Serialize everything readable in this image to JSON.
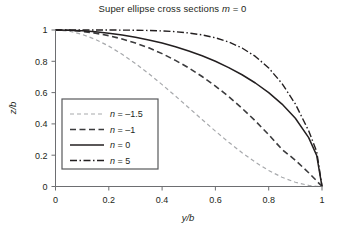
{
  "chart_data": {
    "type": "line",
    "title": "Super ellipse cross sections m = 0",
    "title_plain": "Super ellipse cross sections ",
    "title_italic_var": "m",
    "title_tail": " = 0",
    "xlabel": "y/b",
    "ylabel": "z/b",
    "xlim": [
      0,
      1
    ],
    "ylim": [
      0,
      1
    ],
    "y_axis_inverted": true,
    "grid": false,
    "legend_position": "center-left",
    "xticks": [
      0,
      0.2,
      0.4,
      0.6,
      0.8,
      1
    ],
    "xtick_labels": [
      "0",
      "0.2",
      "0.4",
      "0.6",
      "0.8",
      "1"
    ],
    "yticks": [
      1,
      0.8,
      0.6,
      0.4,
      0.2,
      0
    ],
    "ytick_labels": [
      "1",
      "0.8",
      "0.6",
      "0.4",
      "0.2",
      "0"
    ],
    "x": [
      0,
      0.05,
      0.1,
      0.15,
      0.2,
      0.25,
      0.3,
      0.35,
      0.4,
      0.45,
      0.5,
      0.55,
      0.6,
      0.65,
      0.7,
      0.75,
      0.8,
      0.85,
      0.9,
      0.95,
      0.98,
      1
    ],
    "series": [
      {
        "name": "n = -1.5",
        "label_var": "n",
        "label_value": " = –1.5",
        "n": -1.5,
        "style": "dashed-fine",
        "color": "#a7a9ac",
        "width": 1.2,
        "dasharray": "4,3",
        "values": [
          1,
          0.993,
          0.972,
          0.94,
          0.897,
          0.845,
          0.786,
          0.721,
          0.651,
          0.578,
          0.503,
          0.428,
          0.354,
          0.283,
          0.216,
          0.155,
          0.102,
          0.059,
          0.027,
          0.007,
          0.001,
          0
        ]
      },
      {
        "name": "n = -1",
        "label_var": "n",
        "label_value": " = –1",
        "n": -1,
        "style": "dashed",
        "color": "#3b3b3d",
        "width": 1.6,
        "dasharray": "6,3.5",
        "values": [
          1,
          0.998,
          0.991,
          0.98,
          0.964,
          0.943,
          0.917,
          0.886,
          0.849,
          0.806,
          0.758,
          0.703,
          0.642,
          0.574,
          0.5,
          0.419,
          0.331,
          0.237,
          0.168,
          0.088,
          0.036,
          0
        ]
      },
      {
        "name": "n = 0",
        "label_var": "n",
        "label_value": " = 0",
        "n": 0,
        "style": "solid",
        "color": "#231f20",
        "width": 1.5,
        "dasharray": "none",
        "values": [
          1,
          0.9987,
          0.995,
          0.9887,
          0.9798,
          0.9682,
          0.9539,
          0.9367,
          0.9165,
          0.893,
          0.866,
          0.8352,
          0.8,
          0.7599,
          0.7141,
          0.6614,
          0.6,
          0.5268,
          0.4359,
          0.3122,
          0.199,
          0
        ]
      },
      {
        "name": "n = 5",
        "label_var": "n",
        "label_value": " = 5",
        "n": 5,
        "style": "dash-dot",
        "color": "#231f20",
        "width": 1.4,
        "dasharray": "7,2.5,1.5,2.5",
        "values": [
          1,
          1,
          1,
          0.9999,
          0.9998,
          0.9994,
          0.9986,
          0.997,
          0.9941,
          0.9891,
          0.9811,
          0.9687,
          0.9502,
          0.9233,
          0.8849,
          0.8312,
          0.7573,
          0.6578,
          0.5273,
          0.3559,
          0.2244,
          0
        ]
      }
    ]
  },
  "legend": {
    "entries": [
      {
        "label": "n = –1.5"
      },
      {
        "label": "n = –1"
      },
      {
        "label": "n = 0"
      },
      {
        "label": "n = 5"
      }
    ]
  }
}
